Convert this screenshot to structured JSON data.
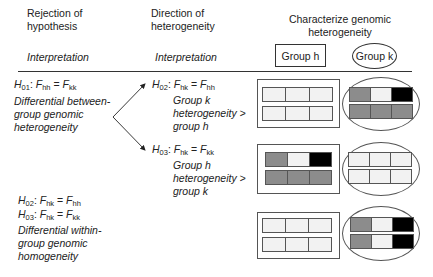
{
  "header": {
    "col1_title": [
      "Rejection of",
      "hypothesis"
    ],
    "col1_sub": "Interpretation",
    "col2_title": [
      "Direction of",
      "heterogeneity"
    ],
    "col2_sub": "Interpretation",
    "col3_title": [
      "Characterize genomic",
      "heterogeneity"
    ],
    "group_h_label": "Group h",
    "group_k_label": "Group k"
  },
  "left": {
    "h01": {
      "H": "H",
      "Hsub": "01",
      "F1": "F",
      "F1sub": "hh",
      "eq": "=",
      "F2": "F",
      "F2sub": "kk"
    },
    "h01_interp": [
      "Differential between-",
      "group genomic",
      "heterogeneity"
    ],
    "h02": {
      "H": "H",
      "Hsub": "02",
      "F1": "F",
      "F1sub": "hk",
      "eq": "=",
      "F2": "F",
      "F2sub": "hh"
    },
    "h03": {
      "H": "H",
      "Hsub": "03",
      "F1": "F",
      "F1sub": "hk",
      "eq": "=",
      "F2": "F",
      "F2sub": "kk"
    },
    "within_interp": [
      "Differential within-",
      "group genomic",
      "homogeneity"
    ]
  },
  "middle": {
    "h02": {
      "H": "H",
      "Hsub": "02",
      "F1": "F",
      "F1sub": "hk",
      "eq": "=",
      "F2": "F",
      "F2sub": "hh"
    },
    "h02_interp": [
      "Group k",
      "heterogeneity >",
      "group h"
    ],
    "h03": {
      "H": "H",
      "Hsub": "03",
      "F1": "F",
      "F1sub": "hk",
      "eq": "=",
      "F2": "F",
      "F2sub": "kk"
    },
    "h03_interp": [
      "Group h",
      "heterogeneity >",
      "group k"
    ]
  },
  "colors": {
    "light": "#f2f2f2",
    "gray": "#8c8c8c",
    "black": "#000000",
    "line": "#333333"
  },
  "rows": [
    {
      "group_h": [
        [
          "light",
          "light",
          "light"
        ],
        [
          "light",
          "light",
          "light"
        ]
      ],
      "group_k": [
        [
          "gray",
          "light",
          "black"
        ],
        [
          "gray",
          "gray",
          "gray"
        ]
      ]
    },
    {
      "group_h": [
        [
          "gray",
          "light",
          "black"
        ],
        [
          "gray",
          "gray",
          "gray"
        ]
      ],
      "group_k": [
        [
          "light",
          "light",
          "light"
        ],
        [
          "light",
          "light",
          "light"
        ]
      ]
    },
    {
      "group_h": [
        [
          "light",
          "light",
          "light"
        ],
        [
          "light",
          "light",
          "light"
        ]
      ],
      "group_k": [
        [
          "gray",
          "light",
          "black"
        ],
        [
          "gray",
          "light",
          "black"
        ]
      ]
    }
  ]
}
